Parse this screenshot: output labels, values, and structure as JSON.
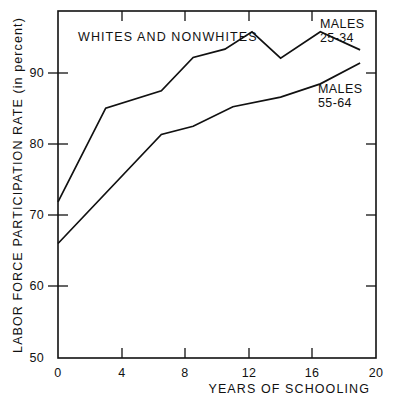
{
  "chart_data": {
    "type": "line",
    "title": "",
    "xlabel": "YEARS OF SCHOOLING",
    "ylabel": "LABOR FORCE PARTICIPATION RATE (in percent)",
    "annotation": "WHITES AND NONWHITES",
    "xlim": [
      0,
      20
    ],
    "ylim": [
      50,
      100
    ],
    "xticks": [
      "0",
      "4",
      "8",
      "12",
      "16",
      "20"
    ],
    "xtick_values": [
      0,
      4,
      8,
      12,
      16,
      20
    ],
    "yticks": [
      "50",
      "60",
      "70",
      "80",
      "90"
    ],
    "ytick_values": [
      50,
      60,
      70,
      80,
      90
    ],
    "grid": false,
    "legend_position": "inline-right",
    "series": [
      {
        "name": "MALES 25-34",
        "label_line1": "MALES",
        "label_line2": "25-34",
        "color": "#111111",
        "x": [
          0,
          3,
          6.5,
          8.5,
          10.5,
          12.2,
          14,
          16.5,
          19
        ],
        "y": [
          72.5,
          86.0,
          88.5,
          93.3,
          94.5,
          97.0,
          93.2,
          97.0,
          94.4
        ]
      },
      {
        "name": "MALES 55-64",
        "label_line1": "MALES",
        "label_line2": "55-64",
        "color": "#111111",
        "x": [
          0,
          6.5,
          8.5,
          11,
          14,
          16.5,
          19
        ],
        "y": [
          66.5,
          82.2,
          83.4,
          86.2,
          87.6,
          89.5,
          92.5
        ]
      }
    ]
  },
  "axis_labels": {
    "y_title": "LABOR FORCE PARTICIPATION RATE (in percent)",
    "x_title": "YEARS OF SCHOOLING"
  },
  "plot_note": "WHITES AND NONWHITES"
}
